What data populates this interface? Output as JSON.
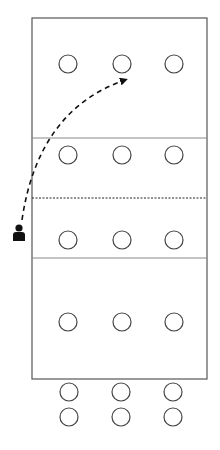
{
  "diagram": {
    "title": "",
    "court": {
      "x": 32,
      "y": 18,
      "width": 175,
      "height": 361,
      "stroke": "#555555"
    },
    "lines": [
      {
        "name": "attack-line-top",
        "y": 138,
        "style": "solid"
      },
      {
        "name": "net-line",
        "y": 198,
        "style": "dotted"
      },
      {
        "name": "attack-line-bottom",
        "y": 258,
        "style": "solid"
      }
    ],
    "players_on_court": [
      {
        "x": 68,
        "y": 64
      },
      {
        "x": 122,
        "y": 64
      },
      {
        "x": 174,
        "y": 64
      },
      {
        "x": 68,
        "y": 155
      },
      {
        "x": 122,
        "y": 155
      },
      {
        "x": 174,
        "y": 155
      },
      {
        "x": 68,
        "y": 240
      },
      {
        "x": 122,
        "y": 240
      },
      {
        "x": 174,
        "y": 240
      },
      {
        "x": 68,
        "y": 322
      },
      {
        "x": 122,
        "y": 322
      },
      {
        "x": 174,
        "y": 322
      }
    ],
    "players_bench": [
      {
        "x": 69,
        "y": 392
      },
      {
        "x": 121,
        "y": 392
      },
      {
        "x": 173,
        "y": 392
      },
      {
        "x": 69,
        "y": 417
      },
      {
        "x": 121,
        "y": 417
      },
      {
        "x": 173,
        "y": 417
      }
    ],
    "player_radius": 9,
    "coach": {
      "x": 19,
      "y": 233,
      "icon": "person-icon"
    },
    "movement_arrow": {
      "from": [
        22,
        220
      ],
      "control": [
        38,
        110
      ],
      "to": [
        125,
        80
      ],
      "style": "dashed"
    }
  }
}
